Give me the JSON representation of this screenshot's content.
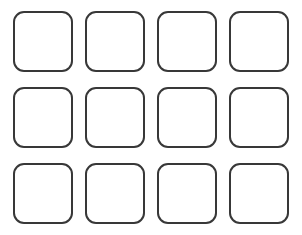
{
  "grid": {
    "rows": 3,
    "columns": 4,
    "tile_style": {
      "stroke_color": "#383838",
      "fill_color": "#ffffff",
      "background_color": "#ffffff"
    },
    "column_x": [
      13,
      85,
      157,
      229
    ],
    "row_y": [
      11,
      87,
      163
    ],
    "tiles": [
      {
        "row": 0,
        "col": 0,
        "label": ""
      },
      {
        "row": 0,
        "col": 1,
        "label": ""
      },
      {
        "row": 0,
        "col": 2,
        "label": ""
      },
      {
        "row": 0,
        "col": 3,
        "label": ""
      },
      {
        "row": 1,
        "col": 0,
        "label": ""
      },
      {
        "row": 1,
        "col": 1,
        "label": ""
      },
      {
        "row": 1,
        "col": 2,
        "label": ""
      },
      {
        "row": 1,
        "col": 3,
        "label": ""
      },
      {
        "row": 2,
        "col": 0,
        "label": ""
      },
      {
        "row": 2,
        "col": 1,
        "label": ""
      },
      {
        "row": 2,
        "col": 2,
        "label": ""
      },
      {
        "row": 2,
        "col": 3,
        "label": ""
      }
    ]
  }
}
